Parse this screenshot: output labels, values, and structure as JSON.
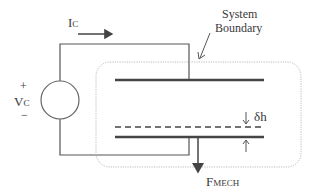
{
  "diagram": {
    "current_label": {
      "main": "I",
      "sub": "C"
    },
    "voltage_label": {
      "main": "V",
      "sub": "C"
    },
    "plus_sign": "+",
    "minus_sign": "−",
    "boundary_label": {
      "line1": "System",
      "line2": "Boundary"
    },
    "gap_label": "δh",
    "force_label": {
      "main": "F",
      "sub": "MECH"
    },
    "colors": {
      "line": "#555555",
      "plate": "#444444",
      "boundary": "#b0b0b0"
    }
  }
}
